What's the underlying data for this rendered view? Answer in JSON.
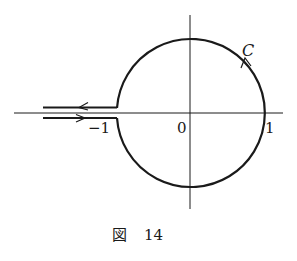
{
  "figure": {
    "caption_prefix": "図",
    "caption_number": "14",
    "contour_label": "C",
    "labels": {
      "origin": "0",
      "one": "1",
      "minus_one": "−1"
    },
    "color": "#1a1a1a"
  }
}
